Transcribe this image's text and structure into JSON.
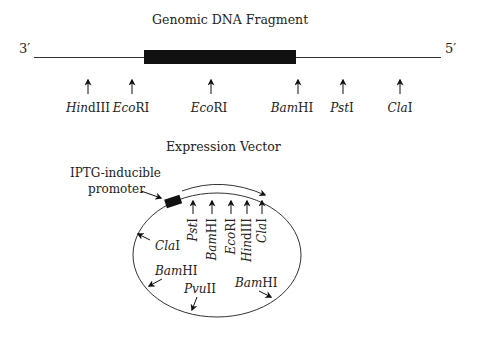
{
  "genomic": {
    "title": "Genomic DNA Fragment",
    "end_left": "3′",
    "end_right": "5′",
    "sites": [
      {
        "italic": "Hin",
        "roman": "dIII",
        "x": 88
      },
      {
        "italic": "Eco",
        "roman": "RI",
        "x": 132
      },
      {
        "italic": "Eco",
        "roman": "RI",
        "x": 211
      },
      {
        "italic": "Bam",
        "roman": "HI",
        "x": 298
      },
      {
        "italic": "Pst",
        "roman": "I",
        "x": 343
      },
      {
        "italic": "Cla",
        "roman": "I",
        "x": 400
      }
    ]
  },
  "vector": {
    "title": "Expression Vector",
    "promoter_label_line1": "IPTG-inducible",
    "promoter_label_line2": "promoter",
    "mcs_sites": [
      {
        "italic": "Pst",
        "roman": "I"
      },
      {
        "italic": "Bam",
        "roman": "HI"
      },
      {
        "italic": "Eco",
        "roman": "RI"
      },
      {
        "italic": "Hin",
        "roman": "dIII"
      },
      {
        "italic": "Cla",
        "roman": "I"
      }
    ],
    "other_sites": [
      {
        "italic": "Cla",
        "roman": "I"
      },
      {
        "italic": "Bam",
        "roman": "HI"
      },
      {
        "italic": "Pvu",
        "roman": "II"
      },
      {
        "italic": "Bam",
        "roman": "HI"
      }
    ]
  }
}
